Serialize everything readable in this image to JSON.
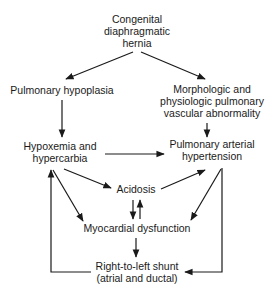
{
  "diagram": {
    "type": "flowchart",
    "nodes": {
      "cdh": {
        "lines": [
          "Congenital",
          "diaphragmatic",
          "hernia"
        ]
      },
      "hypoplasia": {
        "lines": [
          "Pulmonary hypoplasia"
        ]
      },
      "vascular": {
        "lines": [
          "Morphologic and",
          "physiologic pulmonary",
          "vascular abnormality"
        ]
      },
      "hypoxemia": {
        "lines": [
          "Hypoxemia and",
          "hypercarbia"
        ]
      },
      "pah": {
        "lines": [
          "Pulmonary arterial",
          "hypertension"
        ]
      },
      "acidosis": {
        "lines": [
          "Acidosis"
        ]
      },
      "myocardial": {
        "lines": [
          "Myocardial dysfunction"
        ]
      },
      "shunt": {
        "lines": [
          "Right-to-left shunt",
          "(atrial and ductal)"
        ]
      }
    },
    "edges": [
      {
        "from": "Congenital diaphragmatic hernia",
        "to": "Pulmonary hypoplasia"
      },
      {
        "from": "Congenital diaphragmatic hernia",
        "to": "Morphologic and physiologic pulmonary vascular abnormality"
      },
      {
        "from": "Pulmonary hypoplasia",
        "to": "Hypoxemia and hypercarbia"
      },
      {
        "from": "Morphologic and physiologic pulmonary vascular abnormality",
        "to": "Pulmonary arterial hypertension"
      },
      {
        "from": "Hypoxemia and hypercarbia",
        "to": "Pulmonary arterial hypertension"
      },
      {
        "from": "Hypoxemia and hypercarbia",
        "to": "Acidosis"
      },
      {
        "from": "Hypoxemia and hypercarbia",
        "to": "Myocardial dysfunction"
      },
      {
        "from": "Acidosis",
        "to": "Pulmonary arterial hypertension"
      },
      {
        "from": "Acidosis",
        "to": "Myocardial dysfunction"
      },
      {
        "from": "Myocardial dysfunction",
        "to": "Acidosis"
      },
      {
        "from": "Pulmonary arterial hypertension",
        "to": "Myocardial dysfunction"
      },
      {
        "from": "Pulmonary arterial hypertension",
        "to": "Right-to-left shunt (atrial and ductal)"
      },
      {
        "from": "Myocardial dysfunction",
        "to": "Right-to-left shunt (atrial and ductal)"
      },
      {
        "from": "Right-to-left shunt (atrial and ductal)",
        "to": "Hypoxemia and hypercarbia"
      }
    ],
    "colors": {
      "background": "#ffffff",
      "ink": "#1a1a1a"
    }
  }
}
